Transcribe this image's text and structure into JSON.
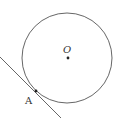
{
  "diagram": {
    "circle": {
      "cx": 67,
      "cy": 58,
      "r": 45,
      "stroke": "#555555"
    },
    "center": {
      "label": "O",
      "x": 68,
      "y": 58
    },
    "tangent_point": {
      "label": "A",
      "x": 36,
      "y": 91
    },
    "tangent_line": {
      "x1": 0,
      "y1": 57,
      "x2": 61,
      "y2": 118
    }
  }
}
